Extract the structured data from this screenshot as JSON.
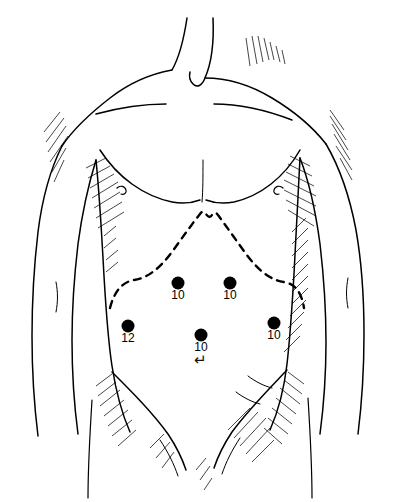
{
  "figure": {
    "view": "anterior",
    "background_color": "#ffffff",
    "ink_color": "#000000",
    "style": "pen-and-ink line drawing with cross-hatch shading"
  },
  "landmarks": {
    "costal_margin": {
      "name": "costal-margin",
      "rendering": "dashed line",
      "shape": "inverted V with double-peak xiphoid apex",
      "dash_color": "#000000"
    },
    "umbilicus": {
      "name": "umbilicus",
      "glyph": "↵",
      "x": 200,
      "y": 360
    }
  },
  "ports": [
    {
      "id": "port-subcostal-left",
      "label": "10",
      "unit": "mm",
      "x": 178,
      "y": 283,
      "region": "left subcostal"
    },
    {
      "id": "port-subcostal-right",
      "label": "10",
      "unit": "mm",
      "x": 230,
      "y": 283,
      "region": "right subcostal"
    },
    {
      "id": "port-lateral-left",
      "label": "12",
      "unit": "mm",
      "x": 128,
      "y": 326,
      "region": "left lateral flank"
    },
    {
      "id": "port-midline",
      "label": "10",
      "unit": "mm",
      "x": 201,
      "y": 335,
      "region": "midline periumbilical"
    },
    {
      "id": "port-lateral-right",
      "label": "10",
      "unit": "mm",
      "x": 274,
      "y": 323,
      "region": "right lateral flank"
    }
  ]
}
